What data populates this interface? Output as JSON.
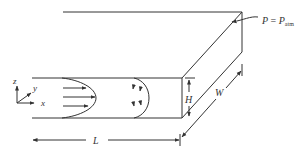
{
  "diagram": {
    "type": "channel-flow-schematic",
    "labels": {
      "length": "L",
      "height": "H",
      "width": "W",
      "pressure_lhs": "P",
      "pressure_eq": " = ",
      "pressure_rhs": "P",
      "pressure_sub": "atm"
    },
    "axes": {
      "x": "x",
      "y": "y",
      "z": "z"
    },
    "colors": {
      "line": "#333333",
      "background": "#ffffff"
    }
  }
}
